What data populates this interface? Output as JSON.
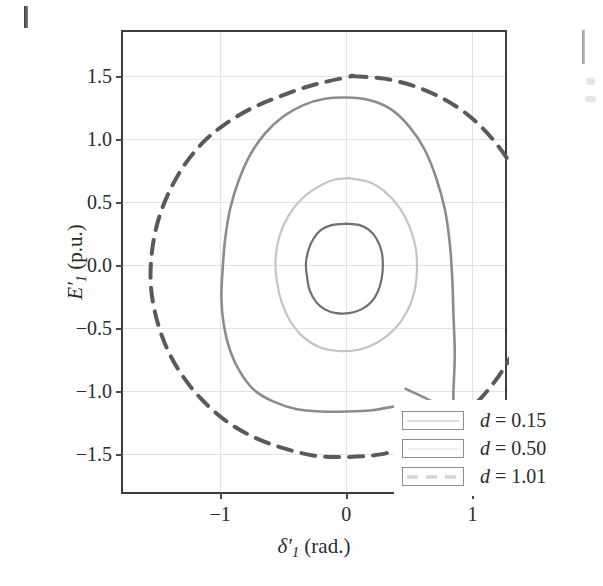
{
  "figure": {
    "background": "#ffffff",
    "axes_color": "#3c3c3c",
    "grid_color": "#e3e3e3"
  },
  "axes": {
    "x": {
      "label_html": "δ′₁ (rad.)",
      "label_var": "δ",
      "label_sub": "1",
      "label_unit": "(rad.)",
      "ticks": [
        "−1",
        "0",
        "1"
      ],
      "tick_values": [
        -1,
        0,
        1
      ],
      "range": [
        -1.77,
        1.29
      ]
    },
    "y": {
      "label_html": "E′₁ (p.u.)",
      "label_var": "E",
      "label_sub": "1",
      "label_unit": "(p.u.)",
      "ticks": [
        "1.5",
        "1.0",
        "0.5",
        "0.0",
        "−0.5",
        "−1.0",
        "−1.5"
      ],
      "tick_values": [
        1.5,
        1.0,
        0.5,
        0.0,
        -0.5,
        -1.0,
        -1.5
      ],
      "range": [
        -1.83,
        1.85
      ]
    }
  },
  "legend": {
    "entries": [
      {
        "label": "d = 0.15",
        "symbol": "d",
        "value": "0.15",
        "color": "#6f6f6f",
        "style": "solid"
      },
      {
        "label": "d = 0.50",
        "symbol": "d",
        "value": "0.50",
        "color": "#c4c4c4",
        "style": "solid"
      },
      {
        "label": "d = 1.01",
        "symbol": "d",
        "value": "1.01",
        "color": "#5a5a5a",
        "style": "dashed"
      }
    ]
  },
  "chart_data": {
    "type": "line",
    "title": "",
    "xlabel": "δ′₁ (rad.)",
    "ylabel": "E′₁ (p.u.)",
    "xlim": [
      -1.77,
      1.29
    ],
    "ylim": [
      -1.83,
      1.85
    ],
    "xticks": [
      -1,
      0,
      1
    ],
    "yticks": [
      -1.5,
      -1.0,
      -0.5,
      0.0,
      0.5,
      1.0,
      1.5
    ],
    "grid": true,
    "legend_position": "lower right",
    "series": [
      {
        "name": "d = 0.15",
        "color": "#6f6f6f",
        "style": "solid",
        "linewidth": 2.2,
        "closed": true,
        "description": "Innermost closed contour centred slightly left of origin.",
        "points": [
          [
            0.0,
            0.33
          ],
          [
            0.1,
            0.32
          ],
          [
            0.18,
            0.28
          ],
          [
            0.24,
            0.21
          ],
          [
            0.28,
            0.11
          ],
          [
            0.29,
            0.0
          ],
          [
            0.28,
            -0.11
          ],
          [
            0.25,
            -0.21
          ],
          [
            0.2,
            -0.29
          ],
          [
            0.12,
            -0.35
          ],
          [
            0.02,
            -0.38
          ],
          [
            -0.08,
            -0.38
          ],
          [
            -0.17,
            -0.35
          ],
          [
            -0.24,
            -0.29
          ],
          [
            -0.29,
            -0.2
          ],
          [
            -0.31,
            -0.1
          ],
          [
            -0.32,
            0.01
          ],
          [
            -0.3,
            0.12
          ],
          [
            -0.26,
            0.21
          ],
          [
            -0.2,
            0.28
          ],
          [
            -0.11,
            0.32
          ],
          [
            0.0,
            0.33
          ]
        ]
      },
      {
        "name": "d = 0.50",
        "color": "#c4c4c4",
        "style": "solid",
        "linewidth": 2.2,
        "closed": true,
        "description": "Middle light-grey closed contour, slightly egg-shaped.",
        "points": [
          [
            0.02,
            0.69
          ],
          [
            0.18,
            0.66
          ],
          [
            0.31,
            0.58
          ],
          [
            0.42,
            0.46
          ],
          [
            0.5,
            0.31
          ],
          [
            0.55,
            0.14
          ],
          [
            0.56,
            -0.04
          ],
          [
            0.54,
            -0.21
          ],
          [
            0.48,
            -0.37
          ],
          [
            0.38,
            -0.51
          ],
          [
            0.25,
            -0.61
          ],
          [
            0.1,
            -0.67
          ],
          [
            -0.06,
            -0.68
          ],
          [
            -0.21,
            -0.65
          ],
          [
            -0.34,
            -0.57
          ],
          [
            -0.44,
            -0.45
          ],
          [
            -0.51,
            -0.3
          ],
          [
            -0.55,
            -0.13
          ],
          [
            -0.56,
            0.05
          ],
          [
            -0.53,
            0.23
          ],
          [
            -0.46,
            0.39
          ],
          [
            -0.35,
            0.53
          ],
          [
            -0.21,
            0.63
          ],
          [
            -0.09,
            0.68
          ],
          [
            0.02,
            0.69
          ]
        ]
      },
      {
        "name": "d = 0.50 outer branch",
        "color": "#8c8c8c",
        "style": "solid",
        "linewidth": 2.6,
        "closed": false,
        "description": "Medium-grey large open spiral branch; enters from the lower right, loops around and ends near the lower right.",
        "points": [
          [
            0.47,
            -0.98
          ],
          [
            0.62,
            -1.05
          ],
          [
            0.76,
            -1.12
          ],
          [
            0.84,
            -1.15
          ],
          [
            0.85,
            -0.98
          ],
          [
            0.86,
            -0.7
          ],
          [
            0.85,
            -0.4
          ],
          [
            0.84,
            -0.1
          ],
          [
            0.82,
            0.18
          ],
          [
            0.78,
            0.45
          ],
          [
            0.71,
            0.7
          ],
          [
            0.62,
            0.92
          ],
          [
            0.5,
            1.1
          ],
          [
            0.35,
            1.24
          ],
          [
            0.18,
            1.31
          ],
          [
            0.0,
            1.33
          ],
          [
            -0.17,
            1.32
          ],
          [
            -0.34,
            1.27
          ],
          [
            -0.5,
            1.18
          ],
          [
            -0.64,
            1.05
          ],
          [
            -0.76,
            0.88
          ],
          [
            -0.85,
            0.68
          ],
          [
            -0.92,
            0.45
          ],
          [
            -0.96,
            0.21
          ],
          [
            -0.98,
            -0.03
          ],
          [
            -0.99,
            -0.26
          ],
          [
            -0.97,
            -0.48
          ],
          [
            -0.92,
            -0.68
          ],
          [
            -0.84,
            -0.85
          ],
          [
            -0.73,
            -0.99
          ],
          [
            -0.58,
            -1.08
          ],
          [
            -0.4,
            -1.14
          ],
          [
            -0.2,
            -1.16
          ],
          [
            0.0,
            -1.16
          ],
          [
            0.2,
            -1.15
          ],
          [
            0.38,
            -1.12
          ],
          [
            0.47,
            -1.1
          ]
        ]
      },
      {
        "name": "d = 1.01",
        "color": "#5a5a5a",
        "style": "dashed",
        "linewidth": 4.0,
        "dash": "14 10",
        "closed": true,
        "description": "Outermost dark dashed closed contour, nearly circular, slightly flattened on upper left.",
        "points": [
          [
            0.05,
            1.5
          ],
          [
            0.3,
            1.48
          ],
          [
            0.54,
            1.42
          ],
          [
            0.77,
            1.32
          ],
          [
            0.98,
            1.18
          ],
          [
            1.16,
            1.0
          ],
          [
            1.31,
            0.79
          ],
          [
            1.42,
            0.55
          ],
          [
            1.48,
            0.29
          ],
          [
            1.5,
            0.02
          ],
          [
            1.47,
            -0.25
          ],
          [
            1.4,
            -0.51
          ],
          [
            1.29,
            -0.75
          ],
          [
            1.14,
            -0.97
          ],
          [
            0.96,
            -1.16
          ],
          [
            0.75,
            -1.31
          ],
          [
            0.52,
            -1.43
          ],
          [
            0.27,
            -1.5
          ],
          [
            0.01,
            -1.52
          ],
          [
            -0.25,
            -1.51
          ],
          [
            -0.5,
            -1.45
          ],
          [
            -0.74,
            -1.36
          ],
          [
            -0.96,
            -1.23
          ],
          [
            -1.15,
            -1.06
          ],
          [
            -1.31,
            -0.86
          ],
          [
            -1.43,
            -0.64
          ],
          [
            -1.51,
            -0.4
          ],
          [
            -1.55,
            -0.15
          ],
          [
            -1.54,
            0.11
          ],
          [
            -1.49,
            0.36
          ],
          [
            -1.4,
            0.59
          ],
          [
            -1.28,
            0.8
          ],
          [
            -1.13,
            0.98
          ],
          [
            -0.96,
            1.12
          ],
          [
            -0.76,
            1.24
          ],
          [
            -0.55,
            1.33
          ],
          [
            -0.33,
            1.41
          ],
          [
            -0.14,
            1.46
          ],
          [
            0.05,
            1.5
          ]
        ]
      }
    ]
  }
}
